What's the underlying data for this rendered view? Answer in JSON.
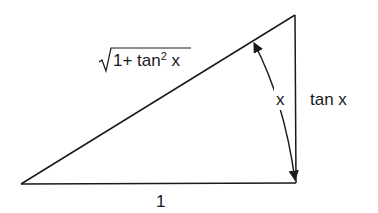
{
  "diagram": {
    "type": "right-triangle",
    "stroke_color": "#1a1a1a",
    "background": "#ffffff",
    "vertices": {
      "bottom_left": [
        21,
        184
      ],
      "bottom_right": [
        296,
        183
      ],
      "top_right": [
        295,
        15
      ]
    },
    "labels": {
      "hypotenuse_radical": "√",
      "hypotenuse_prefix": "1+ tan",
      "hypotenuse_exponent": "2",
      "hypotenuse_suffix": " x",
      "hypotenuse_full": "√(1+tan² x)",
      "angle": "x",
      "vertical_side": "tan x",
      "base": "1"
    },
    "angle_arc": {
      "from": [
        252,
        42
      ],
      "to": [
        296,
        180
      ],
      "arrowheads": "both"
    }
  }
}
